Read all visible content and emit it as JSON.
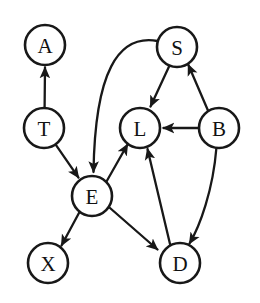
{
  "figure": {
    "width": 260,
    "height": 303,
    "background": "#ffffff",
    "stroke_color": "#181818",
    "label_color": "#111111",
    "node_radius": 20
  },
  "graph_data": {
    "type": "directed-graph",
    "node_count": 8,
    "edge_count": 11,
    "nodes": [
      {
        "id": "A",
        "label": "A",
        "cx": 45,
        "cy": 45
      },
      {
        "id": "S",
        "label": "S",
        "cx": 177,
        "cy": 47
      },
      {
        "id": "T",
        "label": "T",
        "cx": 44,
        "cy": 128
      },
      {
        "id": "L",
        "label": "L",
        "cx": 140,
        "cy": 128
      },
      {
        "id": "B",
        "label": "B",
        "cx": 219,
        "cy": 128
      },
      {
        "id": "E",
        "label": "E",
        "cx": 92,
        "cy": 196
      },
      {
        "id": "X",
        "label": "X",
        "cx": 48,
        "cy": 263
      },
      {
        "id": "D",
        "label": "D",
        "cx": 180,
        "cy": 263
      }
    ],
    "edges": [
      {
        "from": "T",
        "to": "A",
        "shape": "straight"
      },
      {
        "from": "T",
        "to": "E",
        "shape": "straight"
      },
      {
        "from": "B",
        "to": "S",
        "shape": "straight"
      },
      {
        "from": "B",
        "to": "L",
        "shape": "straight"
      },
      {
        "from": "B",
        "to": "D",
        "shape": "curved"
      },
      {
        "from": "S",
        "to": "L",
        "shape": "straight"
      },
      {
        "from": "S",
        "to": "E",
        "shape": "curved"
      },
      {
        "from": "E",
        "to": "L",
        "shape": "straight"
      },
      {
        "from": "E",
        "to": "X",
        "shape": "straight"
      },
      {
        "from": "E",
        "to": "D",
        "shape": "straight"
      },
      {
        "from": "D",
        "to": "L",
        "shape": "straight"
      }
    ]
  }
}
